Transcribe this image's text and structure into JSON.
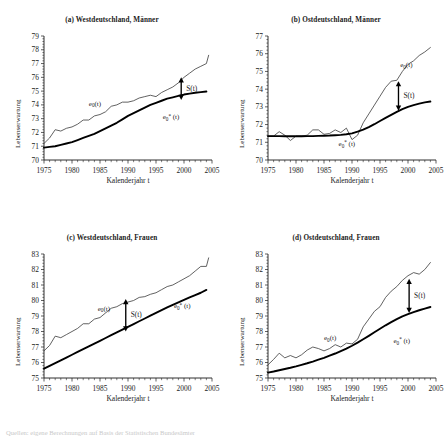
{
  "figure": {
    "xlabel": "Kalenderjahr t",
    "ylabel": "Lebenserwartung",
    "xticks": [
      "1975",
      "1980",
      "1985",
      "1990",
      "1995",
      "2000",
      "2005"
    ],
    "series_labels": {
      "observed": "e",
      "observed_sub": "0",
      "observed_tail": "(t)",
      "fitted": "e",
      "fitted_sub": "0",
      "fitted_sup": "*",
      "fitted_tail": "(t)"
    },
    "gap_label": "S(t)",
    "caption_fragment": "Quellen: eigene Berechnungen auf Basis der Statistischen Bundesämter"
  },
  "chart_data": [
    {
      "type": "line",
      "panel": "a",
      "title": "(a) Westdeutschland, Männer",
      "xlabel": "Kalenderjahr t",
      "ylabel": "Lebenserwartung",
      "xlim": [
        1975,
        2005
      ],
      "ylim": [
        70,
        79
      ],
      "yticks": [
        70,
        71,
        72,
        73,
        74,
        75,
        76,
        77,
        78,
        79
      ],
      "grid": false,
      "legend": "inline-annotations",
      "x": [
        1975,
        1976,
        1977,
        1978,
        1979,
        1980,
        1981,
        1982,
        1983,
        1984,
        1985,
        1986,
        1987,
        1988,
        1989,
        1990,
        1991,
        1992,
        1993,
        1994,
        1995,
        1996,
        1997,
        1998,
        1999,
        2000,
        2001,
        2002,
        2003,
        2004
      ],
      "series": [
        {
          "name": "e0(t)",
          "style": "thin-observed",
          "values": [
            71.2,
            71.6,
            72.2,
            72.1,
            72.3,
            72.4,
            72.6,
            72.9,
            72.9,
            73.2,
            73.3,
            73.5,
            73.9,
            74.0,
            74.2,
            74.2,
            74.3,
            74.5,
            74.6,
            74.7,
            74.6,
            74.9,
            75.1,
            75.3,
            75.6,
            76.0,
            76.3,
            76.6,
            76.8,
            77.0,
            77.6
          ],
          "note": "observed period life expectancy, fluctuating"
        },
        {
          "name": "e0*(t)",
          "style": "thick-fitted",
          "values": [
            70.9,
            70.95,
            71.0,
            71.1,
            71.2,
            71.3,
            71.45,
            71.6,
            71.75,
            71.9,
            72.1,
            72.3,
            72.5,
            72.7,
            72.95,
            73.2,
            73.4,
            73.6,
            73.8,
            74.0,
            74.15,
            74.3,
            74.45,
            74.55,
            74.65,
            74.75,
            74.82,
            74.88,
            74.93,
            74.97
          ],
          "note": "smooth fitted/tempo-adjusted curve"
        }
      ],
      "annotation": {
        "label": "S(t)",
        "x": 1999.5,
        "y_top": 76.0,
        "y_bottom": 74.35,
        "type": "double-arrow"
      }
    },
    {
      "type": "line",
      "panel": "b",
      "title": "(b) Ostdeutschland, Männer",
      "xlabel": "Kalenderjahr t",
      "ylabel": "Lebenserwartung",
      "xlim": [
        1975,
        2005
      ],
      "ylim": [
        70,
        77
      ],
      "yticks": [
        70,
        71,
        72,
        73,
        74,
        75,
        76,
        77
      ],
      "grid": false,
      "legend": "inline-annotations",
      "x": [
        1975,
        1976,
        1977,
        1978,
        1979,
        1980,
        1981,
        1982,
        1983,
        1984,
        1985,
        1986,
        1987,
        1988,
        1989,
        1990,
        1991,
        1992,
        1993,
        1994,
        1995,
        1996,
        1997,
        1998,
        1999,
        2000,
        2001,
        2002,
        2003,
        2004
      ],
      "series": [
        {
          "name": "e0(t)",
          "style": "thin-observed",
          "values": [
            71.35,
            71.35,
            71.6,
            71.4,
            71.1,
            71.35,
            71.35,
            71.4,
            71.7,
            71.7,
            71.45,
            71.5,
            71.7,
            71.55,
            71.8,
            71.15,
            71.4,
            72.1,
            72.6,
            73.1,
            73.6,
            74.1,
            74.45,
            74.5,
            75.0,
            75.4,
            75.6,
            75.9,
            76.1,
            76.35
          ],
          "note": "flat until 1990 then steep rise after reunification"
        },
        {
          "name": "e0*(t)",
          "style": "thick-fitted",
          "values": [
            71.35,
            71.35,
            71.35,
            71.34,
            71.34,
            71.34,
            71.34,
            71.35,
            71.35,
            71.36,
            71.37,
            71.38,
            71.4,
            71.42,
            71.45,
            71.5,
            71.6,
            71.72,
            71.86,
            72.02,
            72.2,
            72.38,
            72.55,
            72.72,
            72.87,
            73.0,
            73.1,
            73.18,
            73.25,
            73.3
          ],
          "note": "smooth fitted curve"
        }
      ],
      "annotation": {
        "label": "S(t)",
        "x": 1998.3,
        "y_top": 74.45,
        "y_bottom": 72.78,
        "type": "double-arrow"
      }
    },
    {
      "type": "line",
      "panel": "c",
      "title": "(c) Westdeutschland, Frauen",
      "xlabel": "Kalenderjahr t",
      "ylabel": "Lebenserwartung",
      "xlim": [
        1975,
        2005
      ],
      "ylim": [
        75,
        83
      ],
      "yticks": [
        75,
        76,
        77,
        78,
        79,
        80,
        81,
        82,
        83
      ],
      "grid": false,
      "legend": "inline-annotations",
      "x": [
        1975,
        1976,
        1977,
        1978,
        1979,
        1980,
        1981,
        1982,
        1983,
        1984,
        1985,
        1986,
        1987,
        1988,
        1989,
        1990,
        1991,
        1992,
        1993,
        1994,
        1995,
        1996,
        1997,
        1998,
        1999,
        2000,
        2001,
        2002,
        2003,
        2004
      ],
      "series": [
        {
          "name": "e0(t)",
          "style": "thin-observed",
          "values": [
            76.75,
            77.1,
            77.7,
            77.6,
            77.8,
            78.0,
            78.2,
            78.5,
            78.5,
            78.8,
            78.9,
            79.2,
            79.5,
            79.6,
            79.8,
            79.9,
            80.0,
            80.2,
            80.25,
            80.4,
            80.5,
            80.7,
            80.9,
            81.0,
            81.2,
            81.4,
            81.6,
            81.9,
            82.2,
            82.2,
            82.75
          ],
          "note": "observed, stepped irregularities"
        },
        {
          "name": "e0*(t)",
          "style": "thick-fitted",
          "values": [
            75.6,
            75.78,
            75.96,
            76.14,
            76.32,
            76.5,
            76.68,
            76.86,
            77.04,
            77.22,
            77.4,
            77.58,
            77.76,
            77.94,
            78.12,
            78.3,
            78.48,
            78.66,
            78.84,
            79.02,
            79.2,
            79.38,
            79.55,
            79.72,
            79.88,
            80.04,
            80.2,
            80.35,
            80.5,
            80.68
          ],
          "note": "nearly linear fitted curve"
        }
      ],
      "annotation": {
        "label": "S(t)",
        "x": 1989.6,
        "y_top": 80.1,
        "y_bottom": 78.0,
        "type": "double-arrow"
      }
    },
    {
      "type": "line",
      "panel": "d",
      "title": "(d) Ostdeutschland, Frauen",
      "xlabel": "Kalenderjahr t",
      "ylabel": "Lebenserwartung",
      "xlim": [
        1975,
        2005
      ],
      "ylim": [
        75,
        83
      ],
      "yticks": [
        75,
        76,
        77,
        78,
        79,
        80,
        81,
        82,
        83
      ],
      "grid": false,
      "legend": "inline-annotations",
      "x": [
        1975,
        1976,
        1977,
        1978,
        1979,
        1980,
        1981,
        1982,
        1983,
        1984,
        1985,
        1986,
        1987,
        1988,
        1989,
        1990,
        1991,
        1992,
        1993,
        1994,
        1995,
        1996,
        1997,
        1998,
        1999,
        2000,
        2001,
        2002,
        2003,
        2004
      ],
      "series": [
        {
          "name": "e0(t)",
          "style": "thin-observed",
          "values": [
            75.85,
            76.2,
            76.6,
            76.3,
            76.45,
            76.3,
            76.5,
            76.8,
            77.0,
            76.9,
            76.75,
            76.9,
            77.15,
            77.0,
            77.25,
            77.2,
            77.5,
            78.3,
            78.8,
            79.3,
            79.6,
            80.2,
            80.6,
            80.9,
            81.3,
            81.6,
            81.8,
            81.7,
            82.0,
            82.45
          ],
          "note": "flat until 1990 then steep rise"
        },
        {
          "name": "e0*(t)",
          "style": "thick-fitted",
          "values": [
            75.35,
            75.42,
            75.5,
            75.58,
            75.66,
            75.75,
            75.85,
            75.95,
            76.06,
            76.18,
            76.3,
            76.44,
            76.58,
            76.74,
            76.9,
            77.08,
            77.28,
            77.5,
            77.72,
            77.95,
            78.18,
            78.4,
            78.6,
            78.8,
            78.98,
            79.12,
            79.25,
            79.37,
            79.48,
            79.58
          ],
          "note": "smooth accelerating fitted curve"
        }
      ],
      "annotation": {
        "label": "S(t)",
        "x": 2000.2,
        "y_top": 81.4,
        "y_bottom": 79.2,
        "type": "double-arrow"
      }
    }
  ]
}
